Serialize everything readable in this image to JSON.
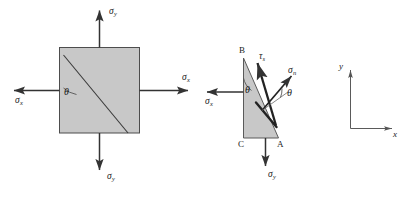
{
  "figure": {
    "background_color": "#ffffff",
    "fill_color": "#c8c8c8",
    "stroke_color": "#4d4d4d",
    "arrow_color": "#333333",
    "text_color": "#1a1a1a"
  },
  "square_element": {
    "name": "square-stress-element",
    "theta_label": "θ",
    "arrows": {
      "top": {
        "label": "σ",
        "sub": "y"
      },
      "bottom": {
        "label": "σ",
        "sub": "y"
      },
      "left": {
        "label": "σ",
        "sub": "x"
      },
      "right": {
        "label": "σ",
        "sub": "x"
      }
    }
  },
  "wedge_element": {
    "name": "triangular-wedge-element",
    "theta_label": "θ",
    "theta_label_2": "θ",
    "vertices": {
      "top": "B",
      "bottom_left": "C",
      "bottom_right": "A"
    },
    "arrows": {
      "left": {
        "label": "σ",
        "sub": "x"
      },
      "bottom": {
        "label": "σ",
        "sub": "y"
      },
      "normal": {
        "label": "σ",
        "sub": "n"
      },
      "shear": {
        "label": "τ",
        "sub": "s"
      }
    }
  },
  "axes": {
    "name": "reference-axes",
    "y_label": "y",
    "x_label": "x"
  }
}
